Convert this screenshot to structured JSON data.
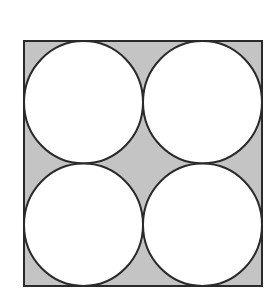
{
  "diagram": {
    "title": "",
    "grid": {
      "rows": 2,
      "cols": 2
    },
    "circles": [
      {
        "id": "top-left",
        "row": 0,
        "col": 0
      },
      {
        "id": "top-right",
        "row": 0,
        "col": 1
      },
      {
        "id": "bottom-left",
        "row": 1,
        "col": 0
      },
      {
        "id": "bottom-right",
        "row": 1,
        "col": 1
      }
    ],
    "colors": {
      "shaded_region": "#c4c4c4",
      "circle_fill": "#ffffff",
      "stroke": "#2a2a2a",
      "background": "#ffffff"
    }
  }
}
